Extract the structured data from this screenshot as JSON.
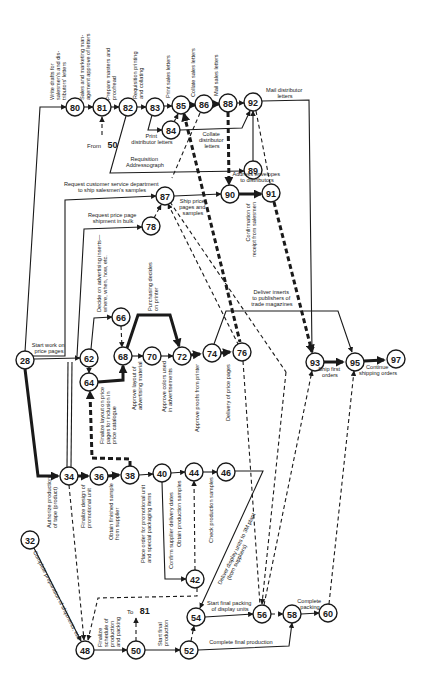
{
  "diagram": {
    "type": "PERT network chart",
    "nodes": [
      {
        "id": "80",
        "x": 75,
        "y": 107
      },
      {
        "id": "81",
        "x": 102,
        "y": 107
      },
      {
        "id": "82",
        "x": 128,
        "y": 107
      },
      {
        "id": "83",
        "x": 155,
        "y": 107
      },
      {
        "id": "84",
        "x": 171,
        "y": 130
      },
      {
        "id": "85",
        "x": 181,
        "y": 105
      },
      {
        "id": "86",
        "x": 204,
        "y": 104
      },
      {
        "id": "88",
        "x": 228,
        "y": 103
      },
      {
        "id": "92",
        "x": 253,
        "y": 102
      },
      {
        "id": "89",
        "x": 253,
        "y": 170
      },
      {
        "id": "87",
        "x": 165,
        "y": 196
      },
      {
        "id": "90",
        "x": 230,
        "y": 194
      },
      {
        "id": "91",
        "x": 271,
        "y": 193
      },
      {
        "id": "78",
        "x": 151,
        "y": 226
      },
      {
        "id": "66",
        "x": 121,
        "y": 317
      },
      {
        "id": "28",
        "x": 25,
        "y": 360
      },
      {
        "id": "62",
        "x": 89,
        "y": 358
      },
      {
        "id": "64",
        "x": 89,
        "y": 382
      },
      {
        "id": "68",
        "x": 123,
        "y": 356
      },
      {
        "id": "70",
        "x": 152,
        "y": 356
      },
      {
        "id": "72",
        "x": 182,
        "y": 356
      },
      {
        "id": "74",
        "x": 212,
        "y": 353
      },
      {
        "id": "76",
        "x": 242,
        "y": 352
      },
      {
        "id": "93",
        "x": 315,
        "y": 362
      },
      {
        "id": "95",
        "x": 355,
        "y": 362
      },
      {
        "id": "97",
        "x": 396,
        "y": 359
      },
      {
        "id": "34",
        "x": 69,
        "y": 476
      },
      {
        "id": "36",
        "x": 99,
        "y": 476
      },
      {
        "id": "38",
        "x": 130,
        "y": 475
      },
      {
        "id": "40",
        "x": 162,
        "y": 473
      },
      {
        "id": "44",
        "x": 194,
        "y": 472
      },
      {
        "id": "46",
        "x": 226,
        "y": 472
      },
      {
        "id": "32",
        "x": 30,
        "y": 540
      },
      {
        "id": "42",
        "x": 195,
        "y": 579
      },
      {
        "id": "54",
        "x": 196,
        "y": 617
      },
      {
        "id": "56",
        "x": 262,
        "y": 614
      },
      {
        "id": "58",
        "x": 292,
        "y": 614
      },
      {
        "id": "60",
        "x": 328,
        "y": 613
      },
      {
        "id": "48",
        "x": 85,
        "y": 650
      },
      {
        "id": "50",
        "x": 136,
        "y": 650
      },
      {
        "id": "52",
        "x": 189,
        "y": 650
      }
    ],
    "labels": {
      "write_drafts": [
        "Write drafts for",
        "salesmen's and dis-",
        "tributors' letters"
      ],
      "approve_letters": [
        "Sales and marketing man-",
        "agement approve of letters"
      ],
      "prepare_masters": [
        "Prepare masters and",
        "proofread"
      ],
      "requisition_printing": [
        "Requisition printing",
        "and collating"
      ],
      "print_sales": "Print sales letters",
      "collate_sales": "Collate sales letters",
      "mail_sales": "Mail sales letters",
      "mail_distributor": [
        "Mail distributor",
        "letters"
      ],
      "from_50_prefix": "From",
      "from_50_num": "50",
      "print_distributor": [
        "Print",
        "distributor letters"
      ],
      "collate_distributor": [
        "Collate",
        "distributor",
        "letters"
      ],
      "requisition_addressograph": [
        "Requisition",
        "Addressograph"
      ],
      "address_envelopes": [
        "Address envelopes",
        "to distributors"
      ],
      "request_customer_service": [
        "Request customer service department",
        "to ship salesmen's samples"
      ],
      "ship_price_pages": [
        "Ship price",
        "pages and",
        "samples"
      ],
      "confirmation_receipt": [
        "Confirmation of",
        "receipt from salesmen"
      ],
      "request_price_page": [
        "Request price page",
        "shipment in bulk"
      ],
      "decide_inserts": [
        "Decide on advertising inserts—",
        "where, when, how, etc."
      ],
      "purchasing_decides": [
        "Purchasing decides",
        "on printer"
      ],
      "deliver_inserts": [
        "Deliver inserts",
        "to publishers of",
        "trade magazines"
      ],
      "start_work_price": [
        "Start work on",
        "price pages"
      ],
      "finalize_layout": [
        "Finalize layout on price",
        "pages for inclusion in",
        "price catalogue"
      ],
      "approve_layout": [
        "Approve layout of",
        "advertising material"
      ],
      "approve_colors": [
        "Approve colors used",
        "in advertisements"
      ],
      "approve_proofs": "Approve proofs from printer",
      "delivery_price_pages": "Delivery of price pages",
      "ship_first": [
        "Ship first",
        "orders"
      ],
      "continue_shipping": [
        "Continue",
        "shipping orders"
      ],
      "authorize_production": [
        "Authorize production",
        "of tape (product)"
      ],
      "finalize_design": [
        "Finalize design of",
        "promotional unit"
      ],
      "obtain_sample": [
        "Obtain finished sample",
        "from supplier"
      ],
      "place_order": [
        "Place order for promotional unit",
        "and special packaging items"
      ],
      "confirm_supplier": "Confirm supplier delivery dates",
      "obtain_production_samples": "Obtain production samples",
      "check_production_samples": "Check production samples",
      "deliver_display": [
        "Deliver display units to 3M plant",
        "(from suppliers)"
      ],
      "complete_preparations": "Complete preparation of shipments, etc.",
      "to_81_prefix": "To",
      "to_81_num": "81",
      "finalize_schedule": [
        "Finalize",
        "schedule of",
        "production",
        "and packing"
      ],
      "start_final_production": [
        "Start final",
        "production"
      ],
      "start_final_packing": [
        "Start final packing",
        "of display units"
      ],
      "complete_packing": [
        "Complete",
        "packing"
      ],
      "complete_final_production": "Complete final production"
    }
  }
}
